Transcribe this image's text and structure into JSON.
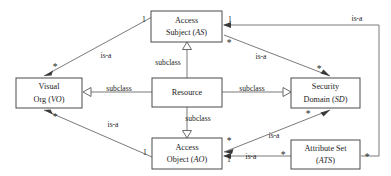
{
  "diagram": {
    "type": "uml-class-diagram",
    "title": "",
    "nodes": [
      {
        "id": "AS",
        "line1": "Access",
        "line2": "Subject (",
        "abbrev": "AS",
        "line2_close": ")",
        "x": 151,
        "y": 11,
        "w": 71,
        "h": 31
      },
      {
        "id": "VO",
        "line1": "Visual",
        "line2": "Org (",
        "abbrev": "VO",
        "line2_close": ")",
        "x": 16,
        "y": 78,
        "w": 66,
        "h": 30
      },
      {
        "id": "RES",
        "line1": "Resource",
        "line2": "",
        "abbrev": "",
        "line2_close": "",
        "x": 152,
        "y": 78,
        "w": 70,
        "h": 29
      },
      {
        "id": "SD",
        "line1": "Security",
        "line2": "Domain (",
        "abbrev": "SD",
        "line2_close": ")",
        "x": 291,
        "y": 78,
        "w": 69,
        "h": 30
      },
      {
        "id": "AO",
        "line1": "Access",
        "line2": "Object (",
        "abbrev": "AO",
        "line2_close": ")",
        "x": 152,
        "y": 138,
        "w": 70,
        "h": 31
      },
      {
        "id": "ATS",
        "line1": "Attribute Set",
        "line2": "(",
        "abbrev": "ATS",
        "line2_close": ")",
        "x": 291,
        "y": 140,
        "w": 69,
        "h": 29
      }
    ],
    "edges": [
      {
        "id": "vo-as",
        "label": "is-a",
        "kind": "association",
        "from": "VO",
        "to": "AS",
        "from_mult": "*",
        "to_mult": "1"
      },
      {
        "id": "res-as",
        "label": "subclass",
        "kind": "generalization",
        "from": "RES",
        "to": "AS",
        "from_mult": "",
        "to_mult": ""
      },
      {
        "id": "as-sd",
        "label": "is-a",
        "kind": "association",
        "from": "AS",
        "to": "SD",
        "from_mult": "*",
        "to_mult": "*"
      },
      {
        "id": "res-vo",
        "label": "subclass",
        "kind": "generalization",
        "from": "RES",
        "to": "VO",
        "from_mult": "",
        "to_mult": ""
      },
      {
        "id": "res-sd",
        "label": "subclass",
        "kind": "generalization",
        "from": "RES",
        "to": "SD",
        "from_mult": "",
        "to_mult": ""
      },
      {
        "id": "res-ao",
        "label": "subclass",
        "kind": "generalization",
        "from": "RES",
        "to": "AO",
        "from_mult": "",
        "to_mult": ""
      },
      {
        "id": "vo-ao",
        "label": "is-a",
        "kind": "association",
        "from": "VO",
        "to": "AO",
        "from_mult": "*",
        "to_mult": "1"
      },
      {
        "id": "ao-sd",
        "label": "is-a",
        "kind": "association",
        "from": "AO",
        "to": "SD",
        "from_mult": "*",
        "to_mult": "*"
      },
      {
        "id": "ats-ao",
        "label": "is-a",
        "kind": "association",
        "from": "ATS",
        "to": "AO",
        "from_mult": "*",
        "to_mult": "1"
      },
      {
        "id": "ats-as",
        "label": "is-a",
        "kind": "association",
        "from": "ATS",
        "to": "AS",
        "from_mult": "*",
        "to_mult": "1"
      }
    ],
    "labels": {
      "is_a": "is-a",
      "subclass": "subclass",
      "one": "1",
      "star": "*"
    },
    "edge_label_text": {
      "vo_as_is_a": "is-a",
      "as_sd_is_a": "is-a",
      "vo_ao_is_a": "is-a",
      "ao_sd_is_a": "is-a",
      "ats_ao_is_a": "is-a",
      "ats_as_is_a": "is-a",
      "res_as_subclass": "subclass",
      "res_vo_subclass": "subclass",
      "res_sd_subclass": "subclass",
      "res_ao_subclass": "subclass"
    },
    "multiplicities": {
      "as_left_one": "1",
      "as_right_one": "1",
      "as_right_star": "*",
      "vo_top_star": "*",
      "vo_bottom_star": "*",
      "sd_top_star": "*",
      "sd_bottom_star": "*",
      "ao_left_one": "1",
      "ao_right_star": "*",
      "ao_right_one": "1",
      "ats_left_star": "*",
      "ats_right_star": "*"
    },
    "node_text": {
      "as_line1": "Access",
      "as_line2_pre": "Subject (",
      "as_abbrev": "AS",
      "as_line2_post": ")",
      "vo_line1": "Visual",
      "vo_line2_pre": "Org (",
      "vo_abbrev": "VO",
      "vo_line2_post": ")",
      "res_line1": "Resource",
      "sd_line1": "Security",
      "sd_line2_pre": "Domain (",
      "sd_abbrev": "SD",
      "sd_line2_post": ")",
      "ao_line1": "Access",
      "ao_line2_pre": "Object (",
      "ao_abbrev": "AO",
      "ao_line2_post": ")",
      "ats_line1": "Attribute Set",
      "ats_line2_pre": "(",
      "ats_abbrev": "ATS",
      "ats_line2_post": ")"
    },
    "colors": {
      "background": "#ffffff",
      "box_stroke": "#4a4a4a",
      "line_stroke": "#6b6b6b",
      "text": "#1c1c1c",
      "arrow_fill": "#3a3a3a"
    }
  }
}
